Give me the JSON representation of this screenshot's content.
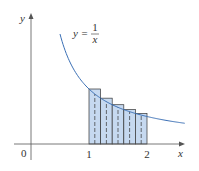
{
  "chart_data": {
    "type": "area",
    "title": "",
    "function_label": {
      "lhs": "y =",
      "num": "1",
      "den": "x"
    },
    "xlabel": "x",
    "ylabel": "y",
    "origin_label": "0",
    "x_ticks": [
      {
        "value": 1,
        "label": "1"
      },
      {
        "value": 2,
        "label": "2"
      }
    ],
    "curve": {
      "function": "1/x",
      "x_range": [
        0.5,
        2.65
      ],
      "color": "#3a6fb5"
    },
    "rectangles": {
      "from": 1,
      "to": 2,
      "count": 5,
      "height_rule": "left endpoint",
      "heights": [
        1.0,
        0.833,
        0.714,
        0.625,
        0.556
      ],
      "fill": "#c6d9f0",
      "stroke": "#333"
    },
    "midlines": "dashed",
    "xlim": [
      -0.5,
      2.7
    ],
    "ylim": [
      -0.3,
      2.4
    ],
    "grid": false
  }
}
